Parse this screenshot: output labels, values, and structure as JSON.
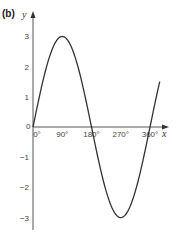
{
  "panel_label": "(b)",
  "chart_data": {
    "type": "line",
    "title": "",
    "function": "y = 3 sin x",
    "xlabel": "x",
    "ylabel": "y",
    "x_ticks": [
      "0°",
      "90°",
      "180°",
      "270°",
      "360°"
    ],
    "x_tick_values": [
      0,
      90,
      180,
      270,
      360
    ],
    "y_ticks": [
      "3",
      "2",
      "1",
      "0",
      "−1",
      "−2",
      "−3"
    ],
    "y_tick_values": [
      3,
      2,
      1,
      0,
      -1,
      -2,
      -3
    ],
    "xlim": [
      0,
      390
    ],
    "ylim": [
      -3.4,
      3.8
    ],
    "grid": false,
    "legend": null,
    "series": [
      {
        "name": "y = 3 sin x",
        "x": [
          0,
          30,
          60,
          90,
          120,
          150,
          180,
          210,
          240,
          270,
          300,
          330,
          360,
          390
        ],
        "values": [
          0,
          1.5,
          2.6,
          3,
          2.6,
          1.5,
          0,
          -1.5,
          -2.6,
          -3,
          -2.6,
          -1.5,
          0,
          1.5
        ]
      }
    ],
    "annotations": [
      {
        "text": "max (90°, 3)"
      },
      {
        "text": "min (270°, −3)"
      }
    ]
  },
  "axis": {
    "x_name": "x",
    "y_name": "y",
    "origin_label": "0"
  }
}
